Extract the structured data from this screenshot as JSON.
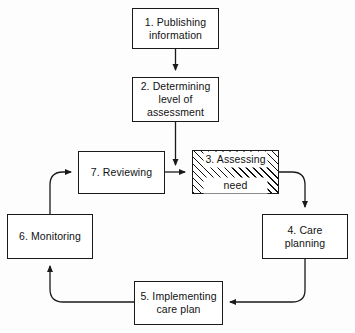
{
  "diagram": {
    "background_color": "#fdfdfd",
    "line_color": "#1a1a1a",
    "highlight_fill": "hatched-diagonal",
    "nodes": [
      {
        "id": "node-1",
        "name": "publishing-information",
        "label": "1. Publishing\ninformation",
        "line1": "1.  Publishing",
        "line2": "information",
        "x": 132,
        "y": 8,
        "w": 87,
        "h": 41,
        "highlighted": false
      },
      {
        "id": "node-2",
        "name": "determining-level-of-assessment",
        "label": "2. Determining\nlevel of\nassessment",
        "line1": "2.  Determining",
        "line2": "level of",
        "line3": "assessment",
        "x": 132,
        "y": 77,
        "w": 87,
        "h": 45,
        "highlighted": false
      },
      {
        "id": "node-3",
        "name": "assessing-need",
        "label": "3. Assessing\nneed",
        "line1": "3.  Assessing",
        "line2": "need",
        "x": 192,
        "y": 150,
        "w": 87,
        "h": 44,
        "highlighted": true
      },
      {
        "id": "node-4",
        "name": "care-planning",
        "label": "4. Care\nplanning",
        "line1": "4.  Care",
        "line2": "planning",
        "x": 262,
        "y": 214,
        "w": 86,
        "h": 45,
        "highlighted": false
      },
      {
        "id": "node-5",
        "name": "implementing-care-plan",
        "label": "5. Implementing\ncare plan",
        "line1": "5.  Implementing",
        "line2": "care plan",
        "x": 134,
        "y": 281,
        "w": 89,
        "h": 44,
        "highlighted": false
      },
      {
        "id": "node-6",
        "name": "monitoring",
        "label": "6. Monitoring",
        "line1": "6.  Monitoring",
        "x": 7,
        "y": 214,
        "w": 86,
        "h": 45,
        "highlighted": false
      },
      {
        "id": "node-7",
        "name": "reviewing",
        "label": "7. Reviewing",
        "line1": "7.  Reviewing",
        "x": 78,
        "y": 151,
        "w": 87,
        "h": 43,
        "highlighted": false
      }
    ],
    "connectors": [
      {
        "name": "connector-1-to-2",
        "from": "node-1",
        "to": "node-2",
        "arrow": true
      },
      {
        "name": "connector-2-to-3",
        "from": "node-2",
        "to": "node-3",
        "arrow": true
      },
      {
        "name": "connector-7-to-3",
        "from": "node-7",
        "to": "node-3",
        "arrow": true
      },
      {
        "name": "connector-3-to-4",
        "from": "node-3",
        "to": "node-4",
        "arrow": true
      },
      {
        "name": "connector-4-to-5",
        "from": "node-4",
        "to": "node-5",
        "arrow": true
      },
      {
        "name": "connector-5-to-6",
        "from": "node-5",
        "to": "node-6",
        "arrow": true
      },
      {
        "name": "connector-6-to-7",
        "from": "node-6",
        "to": "node-7",
        "arrow": true
      }
    ]
  }
}
